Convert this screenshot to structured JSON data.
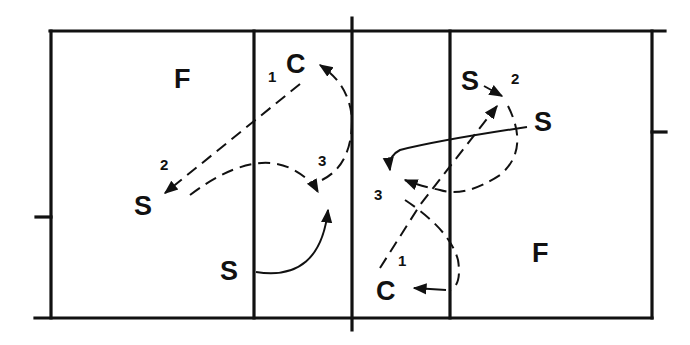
{
  "diagram": {
    "type": "volleyball court play diagram",
    "left_court": {
      "zone_label": "F",
      "players": [
        {
          "role": "C",
          "label": "C",
          "number": "1"
        },
        {
          "role": "S",
          "label": "S",
          "number": "2"
        },
        {
          "role": "S",
          "label": "S",
          "number": ""
        }
      ],
      "path_number": "3"
    },
    "right_court": {
      "zone_label": "F",
      "players": [
        {
          "role": "S",
          "label": "S",
          "number": "2"
        },
        {
          "role": "S",
          "label": "S",
          "number": ""
        },
        {
          "role": "C",
          "label": "C",
          "number": "1"
        }
      ],
      "path_number": "3"
    },
    "legend": {
      "dashed": "ball path",
      "solid": "player movement"
    },
    "colors": {
      "ink": "#111111",
      "background": "#ffffff"
    }
  }
}
